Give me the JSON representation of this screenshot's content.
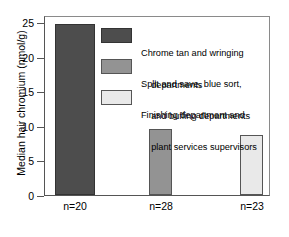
{
  "chart_data": {
    "type": "bar",
    "title": "",
    "xlabel": "",
    "ylabel": "Median hair chromium (nmol/g)",
    "ylim": [
      0,
      26
    ],
    "yticks": [
      0,
      5,
      10,
      15,
      20,
      25
    ],
    "ytick_labels": [
      "0",
      "5",
      "10",
      "15",
      "20",
      "25"
    ],
    "grid": false,
    "legend_position": "inside-upper-right",
    "categories": [
      "n=20",
      "n=28",
      "n=23"
    ],
    "values": [
      25.0,
      9.6,
      8.7
    ],
    "series": [
      {
        "name": "Chrome tan and wringing departments",
        "category": "n=20",
        "value": 25.0,
        "color": "#4d4d4d",
        "edge_color": "#333333"
      },
      {
        "name": "Split and save, blue sort, and buffing departments",
        "category": "n=28",
        "value": 9.6,
        "color": "#939393",
        "edge_color": "#555555"
      },
      {
        "name": "Finishing department and plant services supervisors",
        "category": "n=23",
        "value": 8.7,
        "color": "#e9e9e9",
        "edge_color": "#555555"
      }
    ],
    "legend": [
      {
        "swatch_color": "#4d4d4d",
        "swatch_edge": "#333333",
        "line1": "Chrome tan and wringing",
        "line2": "    departments"
      },
      {
        "swatch_color": "#939393",
        "swatch_edge": "#555555",
        "line1": "Split and save, blue sort,",
        "line2": "    and buffing departments"
      },
      {
        "swatch_color": "#e9e9e9",
        "swatch_edge": "#555555",
        "line1": "Finishing department and",
        "line2": "    plant services supervisors"
      }
    ],
    "annotations": []
  },
  "axes": {
    "y_title": "Median hair chromium (nmol/g)",
    "y_labels": {
      "t0": "0",
      "t1": "5",
      "t2": "10",
      "t3": "15",
      "t4": "20",
      "t5": "25"
    },
    "x_labels": {
      "c0": "n=20",
      "c1": "n=28",
      "c2": "n=23"
    }
  },
  "legend_text": {
    "l0a": "Chrome tan and wringing",
    "l0b": "    departments",
    "l1a": "Split and save, blue sort,",
    "l1b": "    and buffing departments",
    "l2a": "Finishing department and",
    "l2b": "    plant services supervisors"
  }
}
